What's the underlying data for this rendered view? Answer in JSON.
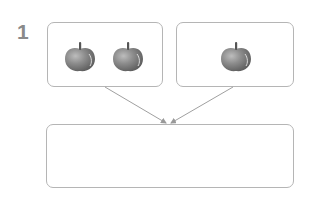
{
  "problem": {
    "number": "1"
  },
  "boxes": {
    "left": {
      "apple_count": 2,
      "icon": "apple-icon"
    },
    "right": {
      "apple_count": 1,
      "icon": "apple-icon"
    },
    "bottom": {
      "content": ""
    }
  },
  "colors": {
    "border": "#b5b5b5",
    "arrow": "#999999",
    "apple_body": "#8c8c8c",
    "number": "#8a8a8a"
  }
}
